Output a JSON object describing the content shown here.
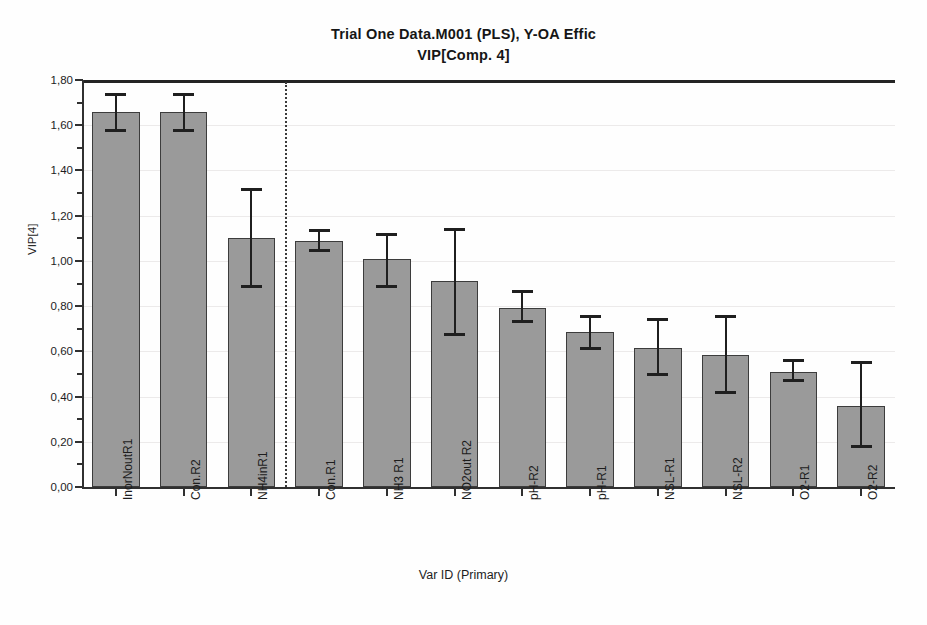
{
  "chart_data": {
    "type": "bar",
    "title": "Trial One Data.M001 (PLS), Y-OA Effic",
    "subtitle": "VIP[Comp. 4]",
    "xlabel": "Var ID (Primary)",
    "ylabel": "VIP[4]",
    "ylim": [
      0.0,
      1.8
    ],
    "ytick_labels": [
      "0,00",
      "0,20",
      "0,40",
      "0,60",
      "0,80",
      "1,00",
      "1,20",
      "1,40",
      "1,60",
      "1,80"
    ],
    "ytick_values": [
      0.0,
      0.2,
      0.4,
      0.6,
      0.8,
      1.0,
      1.2,
      1.4,
      1.6,
      1.8
    ],
    "minor_ticks": true,
    "grid": true,
    "legend": "none",
    "decimal_separator": ",",
    "categories": [
      "InorNoutR1",
      "Con.R2",
      "NH4inR1",
      "Con.R1",
      "NH3 R1",
      "NO2out R2",
      "pH-R2",
      "pH-R1",
      "NSL-R1",
      "NSL-R2",
      "O2-R1",
      "O2-R2"
    ],
    "values": [
      1.66,
      1.66,
      1.1,
      1.09,
      1.01,
      0.91,
      0.79,
      0.685,
      0.615,
      0.585,
      0.51,
      0.36
    ],
    "error_low": [
      1.58,
      1.58,
      0.89,
      1.05,
      0.89,
      0.675,
      0.735,
      0.615,
      0.5,
      0.42,
      0.475,
      0.18
    ],
    "error_high": [
      1.74,
      1.74,
      1.32,
      1.135,
      1.12,
      1.14,
      0.865,
      0.755,
      0.745,
      0.755,
      0.56,
      0.555
    ],
    "annotations": [
      {
        "name": "significance-separator",
        "type": "vertical-dotted-line",
        "after_category_index": 2
      }
    ]
  }
}
